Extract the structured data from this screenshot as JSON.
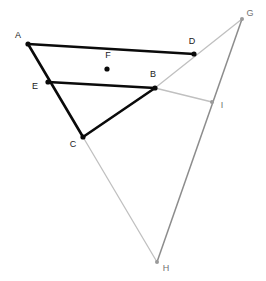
{
  "figure": {
    "kind": "geometry-diagram",
    "width": 266,
    "height": 281,
    "background": "#ffffff",
    "colors": {
      "primary_stroke": "#0a0a0a",
      "light_stroke": "#c0c0c0",
      "mid_stroke": "#8c8c8c",
      "label_dark": "#1a1a1a",
      "label_light": "#707070",
      "point_dark": "#0a0a0a",
      "point_light": "#9a9a9a"
    },
    "points": [
      {
        "id": "A",
        "label": "A",
        "x": 28,
        "y": 44,
        "tone": "dark",
        "label_dx": -10,
        "label_dy": -8
      },
      {
        "id": "B",
        "label": "B",
        "x": 155,
        "y": 88,
        "tone": "dark",
        "label_dx": -2,
        "label_dy": -13
      },
      {
        "id": "C",
        "label": "C",
        "x": 83,
        "y": 137,
        "tone": "dark",
        "label_dx": -10,
        "label_dy": 8
      },
      {
        "id": "D",
        "label": "D",
        "x": 194,
        "y": 54,
        "tone": "dark",
        "label_dx": -2,
        "label_dy": -12
      },
      {
        "id": "E",
        "label": "E",
        "x": 48,
        "y": 82,
        "tone": "dark",
        "label_dx": -13,
        "label_dy": 5
      },
      {
        "id": "F",
        "label": "F",
        "x": 107,
        "y": 69,
        "tone": "dark",
        "label_dx": 1,
        "label_dy": -13
      },
      {
        "id": "G",
        "label": "G",
        "x": 242,
        "y": 19,
        "tone": "light",
        "label_dx": 8,
        "label_dy": -5
      },
      {
        "id": "H",
        "label": "H",
        "x": 157,
        "y": 262,
        "tone": "light",
        "label_dx": 9,
        "label_dy": 7
      },
      {
        "id": "I",
        "label": "I",
        "x": 212,
        "y": 102,
        "tone": "light",
        "label_dx": 10,
        "label_dy": 4
      }
    ],
    "segments": [
      {
        "id": "A-C",
        "from": "A",
        "to": "C",
        "style": "primary",
        "width": 2.6
      },
      {
        "id": "A-D",
        "from": "A",
        "to": "D",
        "style": "primary",
        "width": 2.6
      },
      {
        "id": "E-B",
        "from": "E",
        "to": "B",
        "style": "primary",
        "width": 2.6
      },
      {
        "id": "B-C",
        "from": "B",
        "to": "C",
        "style": "primary",
        "width": 2.6
      },
      {
        "id": "B-G",
        "from": "B",
        "to": "G",
        "style": "light",
        "width": 1.3
      },
      {
        "id": "B-I",
        "from": "B",
        "to": "I",
        "style": "light",
        "width": 1.3
      },
      {
        "id": "C-H",
        "from": "C",
        "to": "H",
        "style": "light",
        "width": 1.3
      },
      {
        "id": "G-H",
        "from": "G",
        "to": "H",
        "style": "mid",
        "width": 1.5
      }
    ],
    "point_radius": {
      "dark": 2.6,
      "light": 2.0
    }
  }
}
